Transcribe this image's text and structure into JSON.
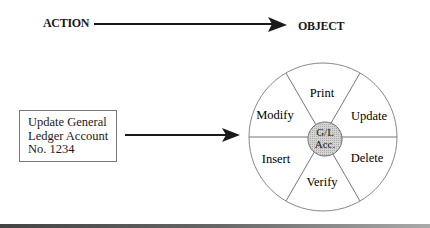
{
  "header": {
    "action_label": "ACTION",
    "object_label": "OBJECT"
  },
  "input_box": {
    "lines": [
      "Update General",
      "Ledger Account",
      "No. 1234"
    ]
  },
  "wheel": {
    "center_label_line1": "G/L",
    "center_label_line2": "Acc.",
    "segments": [
      {
        "label": "Print"
      },
      {
        "label": "Update"
      },
      {
        "label": "Delete"
      },
      {
        "label": "Verify"
      },
      {
        "label": "Insert"
      },
      {
        "label": "Modify"
      }
    ]
  }
}
